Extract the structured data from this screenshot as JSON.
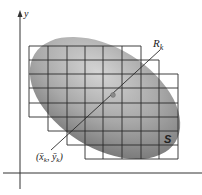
{
  "diagram": {
    "type": "double-integral-partition",
    "axis_labels": {
      "y": "y"
    },
    "region_label": "S",
    "subrectangle_label": {
      "main": "R",
      "sub": "k"
    },
    "sample_point_label": {
      "open": "(",
      "x": "x̄",
      "x_sub": "k",
      "sep": ", ",
      "y": "ȳ",
      "y_sub": "k",
      "close": ")"
    },
    "grid": {
      "columns_x": [
        29,
        48,
        67,
        85,
        103,
        122,
        141,
        159,
        178
      ],
      "rows_y": [
        46,
        60,
        74,
        88,
        103,
        117,
        131,
        145,
        159
      ],
      "row_spans": [
        {
          "row": 1,
          "x_start": 29,
          "x_end": 141
        },
        {
          "row": 2,
          "x_start": 29,
          "x_end": 159
        },
        {
          "row": 3,
          "x_start": 29,
          "x_end": 178
        },
        {
          "row": 4,
          "x_start": 29,
          "x_end": 178
        },
        {
          "row": 5,
          "x_start": 29,
          "x_end": 178
        },
        {
          "row": 6,
          "x_start": 48,
          "x_end": 178
        },
        {
          "row": 7,
          "x_start": 67,
          "x_end": 178
        },
        {
          "row": 8,
          "x_start": 85,
          "x_end": 178
        }
      ]
    },
    "colors": {
      "grid": "#2a2a2a",
      "region_light": "#c8c8c8",
      "region_dark": "#7a7a7a",
      "sample_point": "#8a8a8a",
      "axes": "#333333"
    }
  }
}
